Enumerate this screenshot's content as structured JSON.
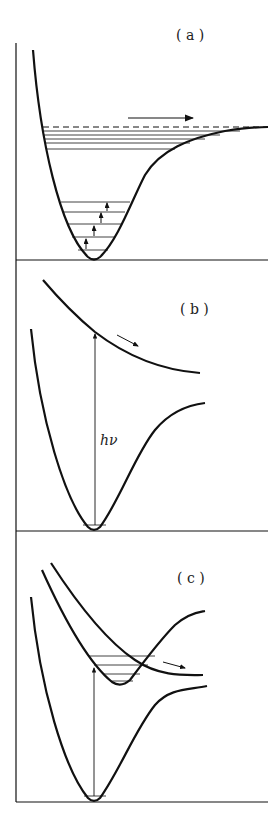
{
  "panels": [
    {
      "id": "a",
      "label": "( a )",
      "description": "Ground-state potential well with vibrational levels; stepwise excitation up to dissociation limit"
    },
    {
      "id": "b",
      "label": "( b )",
      "description": "Photon absorption to repulsive upper state",
      "photon_label": "hν"
    },
    {
      "id": "c",
      "label": "( c )",
      "description": "Excitation to bound state crossed by repulsive state (predissociation)"
    }
  ],
  "colors": {
    "line": "#111111",
    "background": "#ffffff"
  }
}
